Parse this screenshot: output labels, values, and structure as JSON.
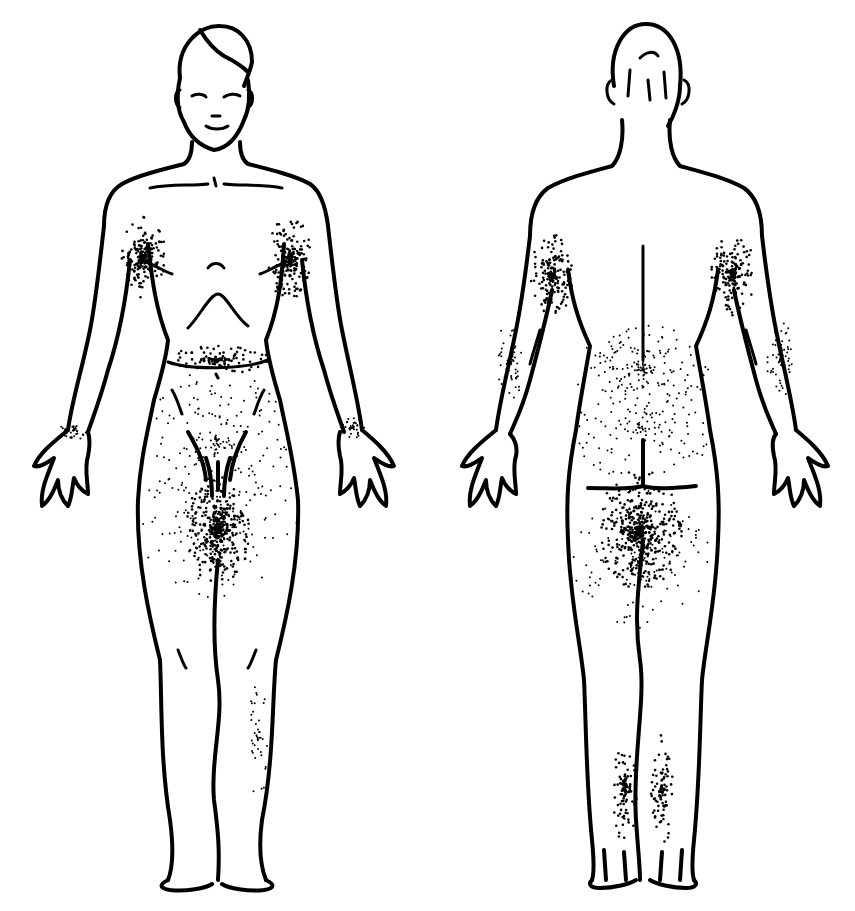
{
  "diagram": {
    "type": "anatomical body chart",
    "views": [
      {
        "id": "front",
        "label": "",
        "center_x": 215,
        "stipple_regions": [
          {
            "name": "right-axilla",
            "cx": 142,
            "cy": 258,
            "rx": 24,
            "ry": 42,
            "density": 220,
            "dark": true
          },
          {
            "name": "left-axilla",
            "cx": 290,
            "cy": 258,
            "rx": 24,
            "ry": 42,
            "density": 220,
            "dark": true
          },
          {
            "name": "waistline",
            "cx": 218,
            "cy": 360,
            "rx": 52,
            "ry": 14,
            "density": 120,
            "dark": true
          },
          {
            "name": "lower-abdomen-flanks",
            "cx": 218,
            "cy": 440,
            "rx": 75,
            "ry": 70,
            "density": 160,
            "dark": false
          },
          {
            "name": "groin-inner-thigh",
            "cx": 218,
            "cy": 530,
            "rx": 32,
            "ry": 55,
            "density": 420,
            "dark": true
          },
          {
            "name": "thighs",
            "cx": 218,
            "cy": 520,
            "rx": 80,
            "ry": 80,
            "density": 160,
            "dark": false
          },
          {
            "name": "right-wrist",
            "cx": 74,
            "cy": 430,
            "rx": 14,
            "ry": 10,
            "density": 40,
            "dark": false
          },
          {
            "name": "left-wrist",
            "cx": 352,
            "cy": 428,
            "rx": 14,
            "ry": 10,
            "density": 40,
            "dark": false
          },
          {
            "name": "right-calf-outer",
            "cx": 258,
            "cy": 740,
            "rx": 10,
            "ry": 60,
            "density": 40,
            "dark": false
          }
        ]
      },
      {
        "id": "back",
        "label": "",
        "center_x": 643,
        "stipple_regions": [
          {
            "name": "right-axilla-back",
            "cx": 552,
            "cy": 275,
            "rx": 22,
            "ry": 42,
            "density": 200,
            "dark": true
          },
          {
            "name": "left-axilla-back",
            "cx": 733,
            "cy": 275,
            "rx": 22,
            "ry": 42,
            "density": 200,
            "dark": true
          },
          {
            "name": "lower-back",
            "cx": 643,
            "cy": 370,
            "rx": 70,
            "ry": 45,
            "density": 180,
            "dark": false
          },
          {
            "name": "right-elbow-back",
            "cx": 510,
            "cy": 360,
            "rx": 14,
            "ry": 40,
            "density": 60,
            "dark": false
          },
          {
            "name": "left-elbow-back",
            "cx": 780,
            "cy": 360,
            "rx": 14,
            "ry": 40,
            "density": 60,
            "dark": false
          },
          {
            "name": "buttocks-sides",
            "cx": 643,
            "cy": 430,
            "rx": 75,
            "ry": 50,
            "density": 120,
            "dark": false
          },
          {
            "name": "gluteal-fold-inner-thigh",
            "cx": 640,
            "cy": 530,
            "rx": 42,
            "ry": 60,
            "density": 520,
            "dark": true
          },
          {
            "name": "posterior-thighs",
            "cx": 640,
            "cy": 560,
            "rx": 72,
            "ry": 70,
            "density": 150,
            "dark": false
          },
          {
            "name": "right-calf-back",
            "cx": 625,
            "cy": 790,
            "rx": 12,
            "ry": 55,
            "density": 110,
            "dark": true
          },
          {
            "name": "left-calf-back",
            "cx": 662,
            "cy": 790,
            "rx": 12,
            "ry": 55,
            "density": 110,
            "dark": true
          }
        ]
      }
    ],
    "colors": {
      "ink": "#000000",
      "background": "#ffffff"
    }
  }
}
